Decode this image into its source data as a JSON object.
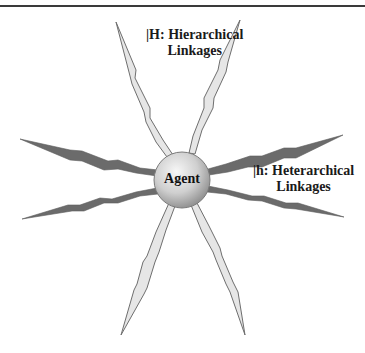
{
  "diagram": {
    "center_node": {
      "label": "Agent"
    },
    "hierarchical": {
      "label_line1": "|H: Hierarchical",
      "label_line2": "Linkages",
      "spike_fill": "#e6e6e6",
      "spike_stroke": "#6e6e6e",
      "count": 4
    },
    "heterarchical": {
      "label_line1": "|h: Heterarchical",
      "label_line2": "Linkages",
      "spike_fill": "#6b6b6b",
      "count": 4
    },
    "colors": {
      "rule": "#3a3a3a",
      "sphere_light": "#f2f2f2",
      "sphere_dark": "#8f8f8f"
    }
  }
}
